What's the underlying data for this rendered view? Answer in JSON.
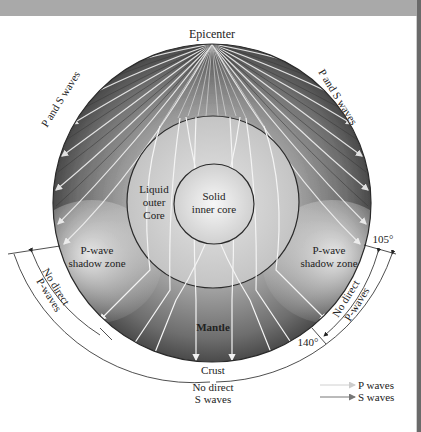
{
  "figure": {
    "title_label": "Epicenter",
    "labels": {
      "p_and_s_left": "P and S waves",
      "p_and_s_right": "P and S waves",
      "outer_core_line1": "Liquid",
      "outer_core_line2": "outer",
      "outer_core_line3": "Core",
      "inner_core_line1": "Solid",
      "inner_core_line2": "inner core",
      "shadow_left_line1": "P-wave",
      "shadow_left_line2": "shadow zone",
      "shadow_right_line1": "P-wave",
      "shadow_right_line2": "shadow zone",
      "no_direct_p_left_line1": "No direct",
      "no_direct_p_left_line2": "P-waves",
      "no_direct_p_right_line1": "No direct",
      "no_direct_p_right_line2": "P-waves",
      "mantle": "Mantle",
      "crust": "Crust",
      "no_direct_s_line1": "No direct",
      "no_direct_s_line2": "S waves",
      "angle_105": "105°",
      "angle_140": "140°"
    },
    "legend": [
      {
        "label": "P waves",
        "style": "light"
      },
      {
        "label": "S waves",
        "style": "dark"
      }
    ],
    "colors": {
      "mantle_dark": "#4a4a4a",
      "mantle_mid": "#8c8c8c",
      "core_light": "#d8d8d8",
      "inner_core_center": "#f4f4f4",
      "ray": "#f2f2f2",
      "outline": "#2a2a2a",
      "top_band": "#a9a9a9"
    }
  }
}
